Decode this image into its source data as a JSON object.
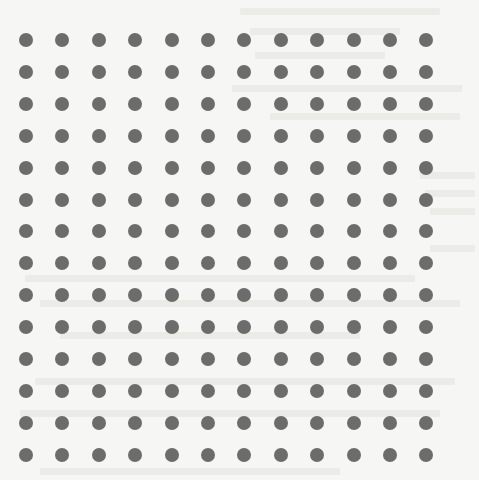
{
  "pattern": {
    "type": "dot-grid",
    "columns": 12,
    "rows": 14,
    "x_start": 26,
    "x_spacing": 36.4,
    "y_start": 40,
    "y_spacing": 31.9,
    "dot_diameter": 14,
    "dot_color": "#6c6c6c",
    "background_color": "#f6f6f4"
  },
  "bleed_through": {
    "description": "faint mirrored text showing through from reverse side of scanned page (illegible)",
    "lines": [
      {
        "x": 240,
        "y": 8,
        "w": 200
      },
      {
        "x": 250,
        "y": 28,
        "w": 150
      },
      {
        "x": 255,
        "y": 52,
        "w": 130
      },
      {
        "x": 232,
        "y": 85,
        "w": 230
      },
      {
        "x": 270,
        "y": 113,
        "w": 190
      },
      {
        "x": 420,
        "y": 172,
        "w": 55
      },
      {
        "x": 425,
        "y": 190,
        "w": 50
      },
      {
        "x": 430,
        "y": 208,
        "w": 45
      },
      {
        "x": 430,
        "y": 245,
        "w": 45
      },
      {
        "x": 25,
        "y": 275,
        "w": 390
      },
      {
        "x": 40,
        "y": 300,
        "w": 420
      },
      {
        "x": 60,
        "y": 332,
        "w": 300
      },
      {
        "x": 35,
        "y": 378,
        "w": 420
      },
      {
        "x": 20,
        "y": 410,
        "w": 420
      },
      {
        "x": 40,
        "y": 468,
        "w": 300
      }
    ]
  }
}
